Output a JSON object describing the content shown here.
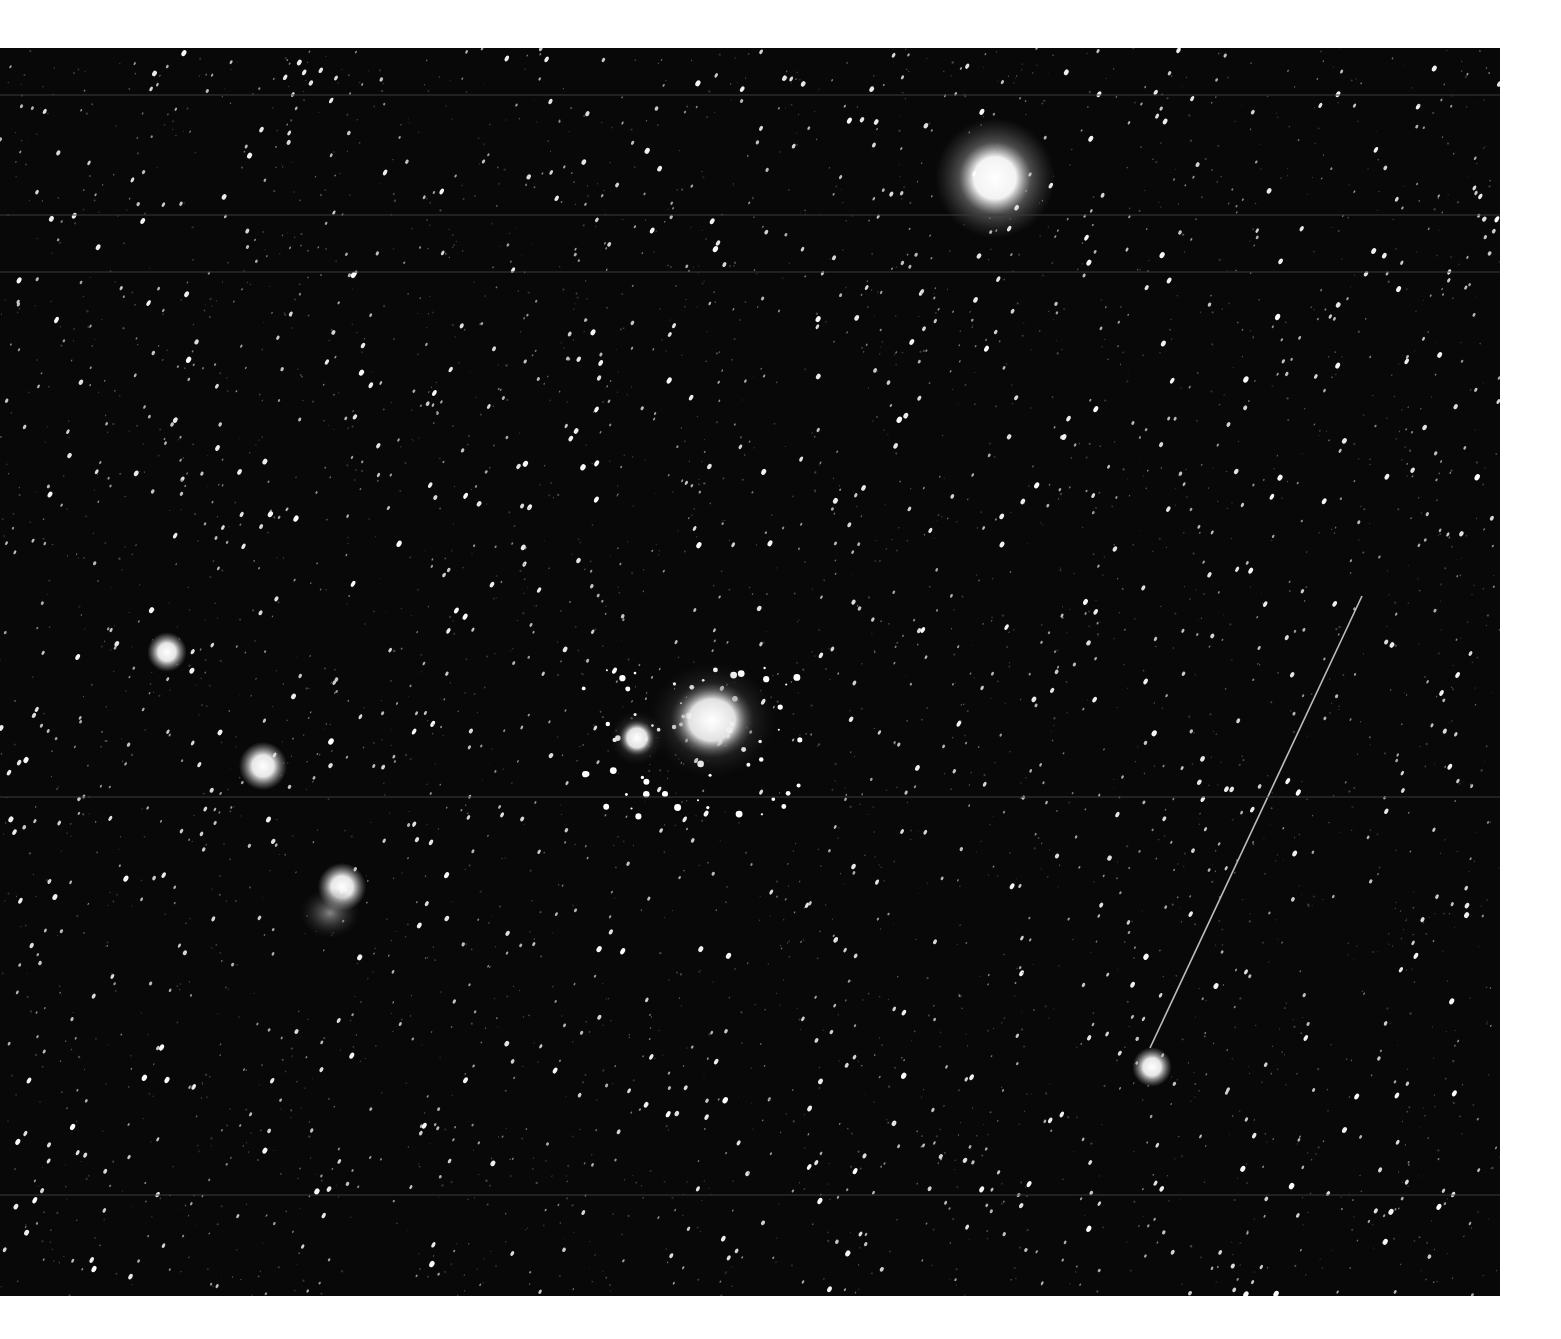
{
  "image": {
    "subject": "Wide-field black and white photograph of the Orion constellation region",
    "frame": {
      "x": 0,
      "y": 48,
      "width": 1500,
      "height": 1248,
      "background": "#080808",
      "margin_color": "#ffffff"
    },
    "features": [
      {
        "name": "bright-star-top",
        "x": 995,
        "y": 130,
        "r": 26,
        "glow": 60
      },
      {
        "name": "orion-nebula",
        "x": 712,
        "y": 672,
        "rx": 42,
        "ry": 38
      },
      {
        "name": "de-mairan-nebula",
        "x": 637,
        "y": 690,
        "rx": 18,
        "ry": 18
      },
      {
        "name": "alnitak-star",
        "x": 342,
        "y": 839,
        "r": 11
      },
      {
        "name": "alnilam-star",
        "x": 263,
        "y": 718,
        "r": 11
      },
      {
        "name": "mintaka-star",
        "x": 167,
        "y": 604,
        "r": 9
      },
      {
        "name": "horsehead-flame-nebula",
        "x": 330,
        "y": 865,
        "rx": 30,
        "ry": 25
      },
      {
        "name": "bright-star-lower-right",
        "x": 1152,
        "y": 1019,
        "r": 9
      }
    ],
    "satellite_trail": {
      "x1": 1362,
      "y1": 548,
      "x2": 1150,
      "y2": 1000
    },
    "scan_lines_y": [
      47,
      167,
      224,
      749,
      1147
    ]
  }
}
